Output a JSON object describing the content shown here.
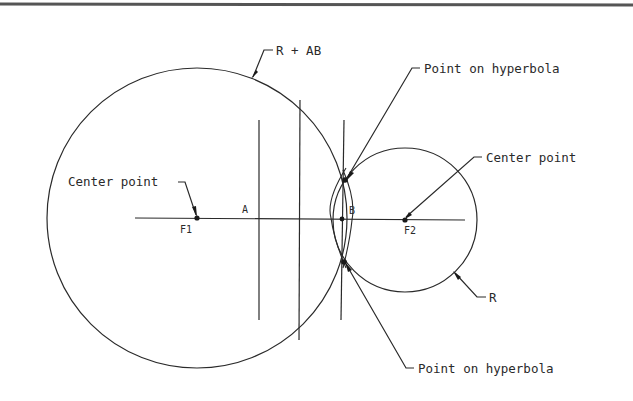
{
  "diagram": {
    "type": "geometric construction",
    "labels": {
      "big_circle_radius": "R + AB",
      "top_point": "Point on hyperbola",
      "bottom_point": "Point on hyperbola",
      "left_center": "Center point",
      "right_center": "Center point",
      "small_circle_radius": "R",
      "point_a": "A",
      "point_b": "B",
      "focus_1": "F1",
      "focus_2": "F2"
    },
    "colors": {
      "line": "#2a2a2a",
      "background": "#ffffff",
      "top_rule": "#555555"
    }
  }
}
